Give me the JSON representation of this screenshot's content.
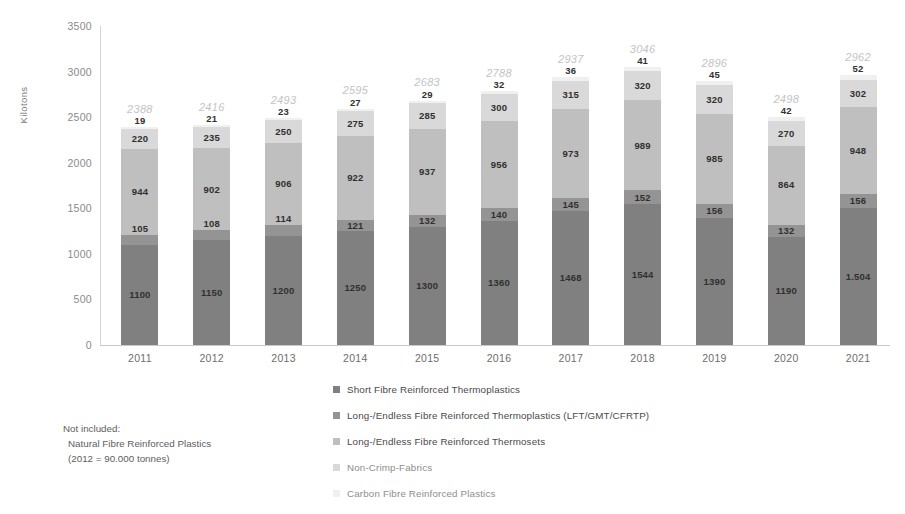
{
  "chart_data": {
    "type": "bar",
    "subtype": "stacked-column",
    "title": "",
    "xlabel": "",
    "ylabel": "Kilotons",
    "ylim": [
      0,
      3500
    ],
    "yticks": [
      3500,
      3000,
      2500,
      2000,
      1500,
      1000,
      500,
      0
    ],
    "grid": false,
    "legend_position": "bottom",
    "categories": [
      "2011",
      "2012",
      "2013",
      "2014",
      "2015",
      "2016",
      "2017",
      "2018",
      "2019",
      "2020",
      "2021"
    ],
    "series": [
      {
        "name": "Short Fibre Reinforced Thermoplastics",
        "color": "#808080",
        "values": [
          1100,
          1150,
          1200,
          1250,
          1300,
          1360,
          1468,
          1544,
          1390,
          1190,
          1504
        ],
        "labels": [
          "1100",
          "1150",
          "1200",
          "1250",
          "1300",
          "1360",
          "1468",
          "1544",
          "1390",
          "1190",
          "1.504"
        ]
      },
      {
        "name": "Long-/Endless Fibre Reinforced Thermoplastics (LFT/GMT/CFRTP)",
        "color": "#949494",
        "values": [
          105,
          108,
          114,
          121,
          132,
          140,
          145,
          152,
          156,
          132,
          156
        ],
        "labels": [
          "105",
          "108",
          "114",
          "121",
          "132",
          "140",
          "145",
          "152",
          "156",
          "132",
          "156"
        ]
      },
      {
        "name": "Long-/Endless Fibre Reinforced Thermosets",
        "color": "#bfbfbf",
        "values": [
          944,
          902,
          906,
          922,
          937,
          956,
          973,
          989,
          985,
          864,
          948
        ],
        "labels": [
          "944",
          "902",
          "906",
          "922",
          "937",
          "956",
          "973",
          "989",
          "985",
          "864",
          "948"
        ]
      },
      {
        "name": "Non-Crimp-Fabrics",
        "color": "#d9d9d9",
        "values": [
          220,
          235,
          250,
          275,
          285,
          300,
          315,
          320,
          320,
          270,
          302
        ],
        "labels": [
          "220",
          "235",
          "250",
          "275",
          "285",
          "300",
          "315",
          "320",
          "320",
          "270",
          "302"
        ]
      },
      {
        "name": "Carbon Fibre Reinforced Plastics",
        "color": "#f0f0f0",
        "values": [
          19,
          21,
          23,
          27,
          29,
          32,
          36,
          41,
          45,
          42,
          52
        ],
        "labels": [
          "19",
          "21",
          "23",
          "27",
          "29",
          "32",
          "36",
          "41",
          "45",
          "42",
          "52"
        ]
      }
    ],
    "totals": [
      2388,
      2416,
      2493,
      2595,
      2683,
      2788,
      2937,
      3046,
      2896,
      2498,
      2962
    ],
    "total_labels": [
      "2388",
      "2416",
      "2493",
      "2595",
      "2683",
      "2788",
      "2937",
      "3046",
      "2896",
      "2498",
      "2962"
    ]
  },
  "annotation": {
    "line1": "Not included:",
    "line2": "Natural Fibre Reinforced Plastics",
    "line3": "(2012 = 90.000 tonnes)"
  },
  "colors": {
    "total_label": "#c3c3c3",
    "axis": "#c9c9c9",
    "tick_text": "#8a8a8a"
  }
}
